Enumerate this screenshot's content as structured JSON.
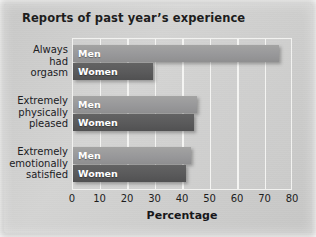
{
  "chart_data": {
    "type": "bar",
    "orientation": "horizontal",
    "title": "Reports of past year’s experience",
    "xlabel": "Percentage",
    "ylabel": "",
    "xlim": [
      0,
      80
    ],
    "xticks": [
      0,
      10,
      20,
      30,
      40,
      50,
      60,
      70,
      80
    ],
    "grid": true,
    "legend": "inside-bar-labels",
    "categories": [
      "Always had orgasm",
      "Extremely physically pleased",
      "Extremely emotionally satisfied"
    ],
    "category_lines": [
      [
        "Always",
        "had",
        "orgasm"
      ],
      [
        "Extremely",
        "physically",
        "pleased"
      ],
      [
        "Extremely",
        "emotionally",
        "satisfied"
      ]
    ],
    "series": [
      {
        "name": "Men",
        "color": "#98989a",
        "values": [
          75,
          45,
          43
        ]
      },
      {
        "name": "Women",
        "color": "#5a5a5b",
        "values": [
          29,
          44,
          41
        ]
      }
    ]
  },
  "colors": {
    "background": "#d0d0cf",
    "men_bar": "#98989a",
    "women_bar": "#5a5a5b",
    "gridline": "#f4f4f2",
    "text": "#1d1d1d"
  }
}
